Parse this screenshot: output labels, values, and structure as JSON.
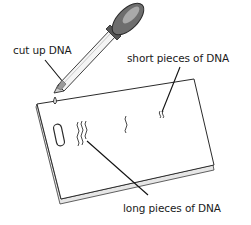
{
  "diagram": {
    "labels": {
      "cut_up_dna": "cut up DNA",
      "short_pieces": "short pieces of DNA",
      "long_pieces": "long pieces of DNA"
    },
    "elements": [
      {
        "name": "dropper",
        "description": "pipette dropper with dark rubber bulb dispensing a drop"
      },
      {
        "name": "gel-slab",
        "description": "rectangular gel slab shown in perspective"
      },
      {
        "name": "well",
        "description": "oval loading well near the left edge"
      },
      {
        "name": "dna-bands",
        "description": "wavy band marks across the gel: long pieces near well, short pieces far"
      }
    ],
    "colors": {
      "line": "#2b2b2b",
      "bulb": "#6e6e6e",
      "bulb_highlight": "#a9a9a9",
      "gel_edge": "#d8d8d8",
      "background": "#ffffff"
    }
  }
}
